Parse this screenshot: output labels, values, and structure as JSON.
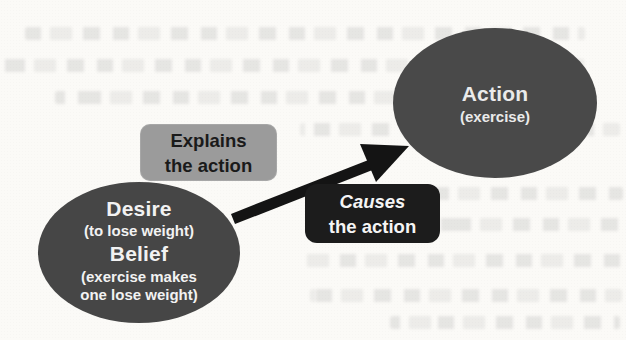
{
  "page": {
    "background_color": "#fbfaf7",
    "artifact_note": "faint illegible bleed-through text from reverse side of scanned page"
  },
  "diagram": {
    "desire_belief_node": {
      "shape": "ellipse",
      "fill": "#464646",
      "text_color": "#f2f2f2",
      "line1": "Desire",
      "line2": "(to lose weight)",
      "line3": "Belief",
      "line4": "(exercise makes",
      "line5": "one lose weight)"
    },
    "action_node": {
      "shape": "ellipse",
      "fill": "#494949",
      "text_color": "#eaeaea",
      "line1": "Action",
      "line2": "(exercise)"
    },
    "explains_label": {
      "fill": "#9b9b9b",
      "text_color": "#1a1a1a",
      "line1": "Explains",
      "line2": "the action"
    },
    "causes_label": {
      "fill": "#1c1c1c",
      "text_color": "#f5f5f5",
      "line1": "Causes",
      "line2": "the action"
    },
    "arrow": {
      "color": "#141414",
      "from": "desire_belief_node",
      "to": "action_node"
    }
  }
}
